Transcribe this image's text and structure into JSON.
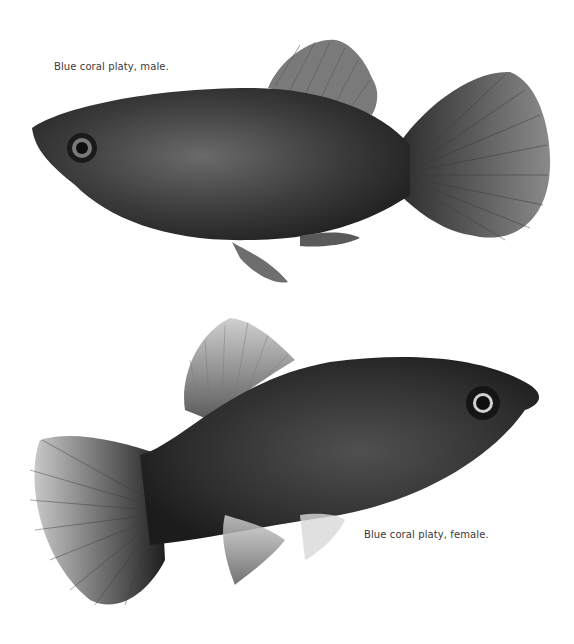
{
  "page": {
    "background": "#ffffff"
  },
  "figures": [
    {
      "id": "male",
      "caption": "Blue coral platy, male.",
      "subject": "fish-male-platy",
      "orientation": "facing-left"
    },
    {
      "id": "female",
      "caption": "Blue coral platy, female.",
      "subject": "fish-female-platy",
      "orientation": "facing-right"
    }
  ],
  "colors": {
    "body_dark": "#2a2a2a",
    "body_mid": "#4a4a4a",
    "fin": "#6a6a6a",
    "caption_text": "#3a3a3a"
  }
}
